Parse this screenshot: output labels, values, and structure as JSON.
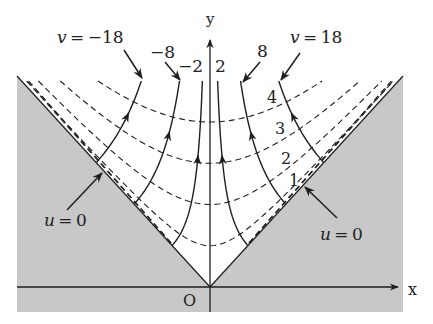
{
  "diagram": {
    "title": "",
    "axes": {
      "x_label": "x",
      "y_label": "y",
      "origin_label": "O"
    },
    "colors": {
      "shade": "#c8c8c8",
      "line": "#1e1e1e",
      "background": "#ffffff"
    },
    "geometry": {
      "origin_px": [
        210,
        287
      ],
      "y_scale": 1.1,
      "shade_rect": [
        17,
        76,
        403,
        312
      ],
      "x_axis_end": 398,
      "y_axis_top": 40,
      "curve_top_py": 81
    },
    "u_curves": {
      "description": "dashed curves of constant u",
      "label_prefix": "",
      "values": [
        1,
        2,
        3,
        4
      ],
      "scale": 37.5,
      "labels": [
        {
          "text": "1",
          "x": 289,
          "y": 186
        },
        {
          "text": "2",
          "x": 281,
          "y": 164
        },
        {
          "text": "3",
          "x": 275,
          "y": 134
        },
        {
          "text": "4",
          "x": 267,
          "y": 103
        }
      ],
      "extra_near_boundary": [
        4.6,
        4.85
      ]
    },
    "v_curves": {
      "description": "flow lines of constant v with arrows",
      "values": [
        -18,
        -8,
        -2,
        2,
        8,
        18
      ],
      "scale": 715,
      "labels": [
        {
          "text": "v = −18",
          "x": 57,
          "y": 43,
          "arrow": [
            124,
            50,
            142,
            78
          ]
        },
        {
          "text": "−8",
          "x": 150,
          "y": 58,
          "arrow": [
            165,
            62,
            180,
            80
          ]
        },
        {
          "text": "−2",
          "x": 178,
          "y": 72,
          "arrow": null
        },
        {
          "text": "2",
          "x": 215,
          "y": 72,
          "arrow": null
        },
        {
          "text": "8",
          "x": 257,
          "y": 57,
          "arrow": [
            260,
            62,
            243,
            82
          ]
        },
        {
          "text": "v = 18",
          "x": 290,
          "y": 43,
          "arrow": [
            300,
            53,
            281,
            80
          ]
        }
      ]
    },
    "boundary_labels": [
      {
        "text": "u = 0",
        "x": 44,
        "y": 226,
        "arrow": [
          67,
          210,
          102,
          173
        ]
      },
      {
        "text": "u = 0",
        "x": 320,
        "y": 240,
        "arrow": [
          337,
          218,
          305,
          187
        ]
      }
    ]
  }
}
